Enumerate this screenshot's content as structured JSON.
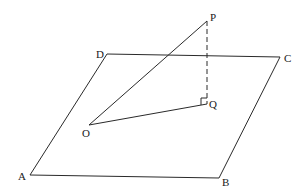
{
  "diagram": {
    "type": "3d-geometry",
    "plane": {
      "name": "ABCD",
      "vertices": [
        {
          "id": "A",
          "label": "A",
          "x": 30,
          "y": 175,
          "lx": 18,
          "ly": 180
        },
        {
          "id": "B",
          "label": "B",
          "x": 219,
          "y": 178,
          "lx": 222,
          "ly": 186
        },
        {
          "id": "C",
          "label": "C",
          "x": 280,
          "y": 57,
          "lx": 284,
          "ly": 62
        },
        {
          "id": "D",
          "label": "D",
          "x": 107,
          "y": 54,
          "lx": 96,
          "ly": 58
        }
      ]
    },
    "points": {
      "P": {
        "label": "P",
        "x": 207,
        "y": 21,
        "lx": 210,
        "ly": 21
      },
      "Q": {
        "label": "Q",
        "x": 207,
        "y": 104,
        "lx": 209,
        "ly": 108
      },
      "O": {
        "label": "O",
        "x": 89,
        "y": 125,
        "lx": 82,
        "ly": 137
      }
    },
    "segments": [
      {
        "from": "O",
        "to": "P",
        "style": "solid"
      },
      {
        "from": "O",
        "to": "Q",
        "style": "solid"
      },
      {
        "from": "P",
        "to": "Q",
        "style": "dashed"
      }
    ],
    "right_angle_marker": {
      "at": "Q",
      "size": 6
    },
    "colors": {
      "line": "#2a2a2a",
      "text": "#1a1a1a",
      "background": "#ffffff"
    }
  }
}
